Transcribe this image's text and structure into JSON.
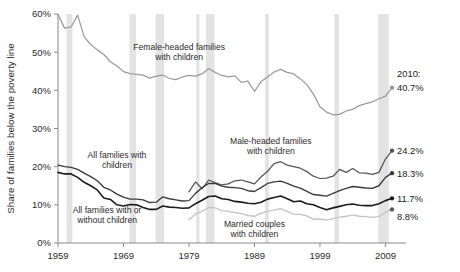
{
  "chart_data": {
    "type": "line",
    "title": "",
    "xlabel": "",
    "ylabel": "Share of families below the poverty line",
    "xlim": [
      1959,
      2010
    ],
    "ylim": [
      0,
      60
    ],
    "grid": false,
    "legend_position": "inline-annotations",
    "y_tick_labels": [
      "0%",
      "10%",
      "20%",
      "30%",
      "40%",
      "50%",
      "60%"
    ],
    "y_ticks": [
      0,
      10,
      20,
      30,
      40,
      50,
      60
    ],
    "x_tick_labels": [
      "1959",
      "1969",
      "1979",
      "1989",
      "1999",
      "2009"
    ],
    "x_ticks": [
      1959,
      1969,
      1979,
      1989,
      1999,
      2009
    ],
    "shaded_regions_note": "Recession bands (vertical grey stripes)",
    "shaded_regions": [
      [
        1960.3,
        1961.2
      ],
      [
        1969.9,
        1970.9
      ],
      [
        1973.9,
        1975.2
      ],
      [
        1980.1,
        1980.6
      ],
      [
        1981.6,
        1982.9
      ],
      [
        1990.6,
        1991.2
      ],
      [
        2001.2,
        2001.9
      ],
      [
        2007.9,
        2009.5
      ]
    ],
    "annotations": [
      {
        "id": "female-headed",
        "text_line1": "Female-headed families",
        "text_line2": "with children",
        "x": 1977.5,
        "y": 50.5
      },
      {
        "id": "male-headed",
        "text_line1": "Male-headed families",
        "text_line2": "with children",
        "x": 1991.5,
        "y": 26.0
      },
      {
        "id": "all-families-children",
        "text_line1": "All families with",
        "text_line2": "children",
        "x": 1968.0,
        "y": 22.3
      },
      {
        "id": "all-families-any",
        "text_line1": "All families with or",
        "text_line2": "without children",
        "x": 1966.5,
        "y": 7.8
      },
      {
        "id": "married-couples",
        "text_line1": "Married couples",
        "text_line2": "with children",
        "x": 1989.0,
        "y": 4.2
      }
    ],
    "end_labels": [
      {
        "series": "Female-headed families with children",
        "year_text": "2010:",
        "value_text": "40.7%",
        "value": 40.7
      },
      {
        "series": "Male-headed families with children",
        "year_text": "",
        "value_text": "24.2%",
        "value": 24.2
      },
      {
        "series": "All families with children",
        "year_text": "",
        "value_text": "18.3%",
        "value": 18.3
      },
      {
        "series": "All families with or without children",
        "year_text": "",
        "value_text": "11.7%",
        "value": 11.7
      },
      {
        "series": "Married couples with children",
        "year_text": "",
        "value_text": "8.8%",
        "value": 8.8
      }
    ],
    "colors": {
      "female_headed": "#9a9a9a",
      "male_headed": "#555555",
      "all_families_children": "#3a3a3a",
      "all_families_any": "#1c1c1c",
      "married_couples": "#c4c4c4",
      "recession_band": "#e3e3e3",
      "axis": "#8a8a8a",
      "text": "#2b2b2b"
    },
    "x": [
      1959,
      1960,
      1961,
      1962,
      1963,
      1964,
      1965,
      1966,
      1967,
      1968,
      1969,
      1970,
      1971,
      1972,
      1973,
      1974,
      1975,
      1976,
      1977,
      1978,
      1979,
      1980,
      1981,
      1982,
      1983,
      1984,
      1985,
      1986,
      1987,
      1988,
      1989,
      1990,
      1991,
      1992,
      1993,
      1994,
      1995,
      1996,
      1997,
      1998,
      1999,
      2000,
      2001,
      2002,
      2003,
      2004,
      2005,
      2006,
      2007,
      2008,
      2009,
      2010
    ],
    "series": [
      {
        "name": "Female-headed families with children",
        "color": "#9a9a9a",
        "values": [
          59.9,
          56.3,
          56.6,
          59.7,
          54.0,
          52.0,
          50.6,
          49.4,
          47.5,
          46.4,
          44.9,
          44.4,
          44.2,
          44.0,
          43.2,
          43.7,
          44.0,
          43.1,
          42.8,
          43.5,
          43.9,
          43.7,
          44.3,
          45.7,
          44.7,
          43.9,
          43.5,
          43.8,
          42.1,
          42.4,
          39.7,
          42.3,
          43.5,
          44.8,
          45.5,
          44.7,
          44.3,
          43.0,
          41.5,
          39.0,
          35.7,
          34.3,
          33.6,
          33.7,
          34.6,
          35.0,
          36.0,
          36.5,
          37.0,
          37.8,
          38.5,
          40.7
        ]
      },
      {
        "name": "Male-headed families with children",
        "color": "#555555",
        "values": [
          null,
          null,
          null,
          null,
          null,
          null,
          null,
          null,
          null,
          null,
          null,
          null,
          null,
          null,
          null,
          null,
          null,
          null,
          null,
          null,
          13.4,
          16.0,
          14.2,
          16.5,
          15.8,
          15.2,
          15.5,
          16.3,
          16.5,
          16.0,
          15.5,
          17.3,
          18.8,
          20.8,
          21.3,
          20.4,
          20.0,
          19.6,
          18.7,
          17.5,
          16.9,
          17.0,
          17.5,
          19.3,
          18.5,
          19.5,
          18.4,
          18.3,
          18.0,
          18.5,
          22.0,
          24.2
        ]
      },
      {
        "name": "All families with children",
        "color": "#3a3a3a",
        "values": [
          20.4,
          20.0,
          19.8,
          19.3,
          18.3,
          17.4,
          16.3,
          14.6,
          13.9,
          12.8,
          12.0,
          11.5,
          11.5,
          11.3,
          10.6,
          10.7,
          12.1,
          11.6,
          11.3,
          11.0,
          11.1,
          13.0,
          14.5,
          15.6,
          15.6,
          14.9,
          14.6,
          14.5,
          14.3,
          13.7,
          13.5,
          14.5,
          15.6,
          16.0,
          16.2,
          15.6,
          14.9,
          14.4,
          13.5,
          12.7,
          12.5,
          12.3,
          13.0,
          13.7,
          14.3,
          14.8,
          14.6,
          14.4,
          14.3,
          15.0,
          17.2,
          18.3
        ]
      },
      {
        "name": "All families with or without children",
        "color": "#1c1c1c",
        "values": [
          18.5,
          18.1,
          18.1,
          17.2,
          15.9,
          15.0,
          13.9,
          11.8,
          11.4,
          10.0,
          9.7,
          10.1,
          10.0,
          9.3,
          8.8,
          8.8,
          9.7,
          9.4,
          9.3,
          9.1,
          9.2,
          10.3,
          11.2,
          12.2,
          12.3,
          11.6,
          11.4,
          10.9,
          10.7,
          10.4,
          10.3,
          10.7,
          11.5,
          11.9,
          12.3,
          11.6,
          10.8,
          11.0,
          10.3,
          10.0,
          9.3,
          8.7,
          9.2,
          9.6,
          10.0,
          10.2,
          9.9,
          9.8,
          9.8,
          10.3,
          11.1,
          11.7
        ]
      },
      {
        "name": "Married couples with children",
        "color": "#c4c4c4",
        "values": [
          null,
          null,
          null,
          null,
          null,
          null,
          null,
          null,
          null,
          null,
          null,
          null,
          null,
          null,
          null,
          null,
          null,
          null,
          null,
          null,
          6.1,
          7.6,
          8.3,
          9.3,
          9.2,
          8.5,
          8.3,
          8.0,
          7.7,
          7.2,
          7.0,
          7.8,
          8.3,
          8.6,
          9.0,
          8.3,
          7.5,
          7.5,
          7.1,
          6.2,
          6.3,
          6.0,
          6.4,
          6.8,
          7.0,
          7.3,
          7.0,
          6.9,
          6.7,
          6.9,
          8.0,
          8.8
        ]
      }
    ]
  }
}
